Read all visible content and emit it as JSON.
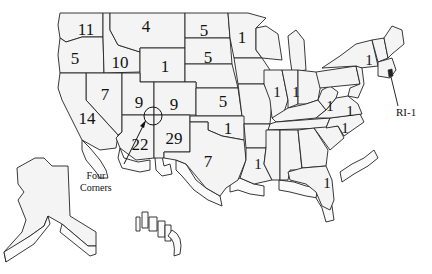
{
  "map": {
    "title": "",
    "states": [
      {
        "id": "WA",
        "value": "11",
        "x": 86,
        "y": 29
      },
      {
        "id": "OR",
        "value": "5",
        "x": 75,
        "y": 58
      },
      {
        "id": "ID",
        "value": "10",
        "x": 120,
        "y": 62
      },
      {
        "id": "MT",
        "value": "4",
        "x": 146,
        "y": 26
      },
      {
        "id": "WY",
        "value": "1",
        "x": 165,
        "y": 66
      },
      {
        "id": "ND",
        "value": "5",
        "x": 204,
        "y": 30
      },
      {
        "id": "SD",
        "value": "5",
        "x": 208,
        "y": 57
      },
      {
        "id": "MN",
        "value": "1",
        "x": 242,
        "y": 37
      },
      {
        "id": "NV",
        "value": "7",
        "x": 105,
        "y": 94
      },
      {
        "id": "UT",
        "value": "9",
        "x": 139,
        "y": 102
      },
      {
        "id": "CO",
        "value": "9",
        "x": 174,
        "y": 104
      },
      {
        "id": "KS",
        "value": "5",
        "x": 223,
        "y": 101
      },
      {
        "id": "CA",
        "value": "14",
        "x": 87,
        "y": 118
      },
      {
        "id": "AZ",
        "value": "22",
        "x": 140,
        "y": 144
      },
      {
        "id": "NM",
        "value": "29",
        "x": 174,
        "y": 138
      },
      {
        "id": "OK",
        "value": "1",
        "x": 228,
        "y": 128
      },
      {
        "id": "TX",
        "value": "7",
        "x": 208,
        "y": 161
      },
      {
        "id": "IL",
        "value": "1",
        "x": 277,
        "y": 92
      },
      {
        "id": "IN",
        "value": "1",
        "x": 296,
        "y": 92
      },
      {
        "id": "WV",
        "value": "1",
        "x": 330,
        "y": 106
      },
      {
        "id": "VA",
        "value": "1",
        "x": 350,
        "y": 111
      },
      {
        "id": "NC",
        "value": "1",
        "x": 345,
        "y": 128
      },
      {
        "id": "LA",
        "value": "1",
        "x": 258,
        "y": 164
      },
      {
        "id": "FL",
        "value": "1",
        "x": 327,
        "y": 183
      },
      {
        "id": "NY",
        "value": "1",
        "x": 369,
        "y": 60
      }
    ],
    "annotations": {
      "ri_label": "RI-1",
      "four_corners_line1": "Four",
      "four_corners_line2": "Corners"
    },
    "colors": {
      "fill": "#f4f4f4",
      "stroke": "#222222",
      "background": "#ffffff"
    }
  }
}
